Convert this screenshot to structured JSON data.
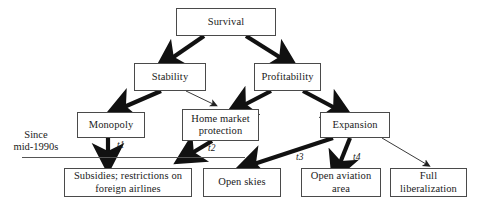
{
  "diagram": {
    "colors": {
      "box_border": "#4a4a4a",
      "box_fill": "#ffffff",
      "arrow_thick": "#111111",
      "arrow_thin": "#333333",
      "text": "#1a1a1a",
      "timeline_line": "#555555"
    },
    "nodes": [
      {
        "id": "survival",
        "label": "Survival"
      },
      {
        "id": "stability",
        "label": "Stability"
      },
      {
        "id": "profitability",
        "label": "Profitability"
      },
      {
        "id": "monopoly",
        "label": "Monopoly"
      },
      {
        "id": "home-market-protection",
        "label": "Home market protection"
      },
      {
        "id": "expansion",
        "label": "Expansion"
      },
      {
        "id": "subsidies-restrictions",
        "label": "Subsidies; restrictions on foreign airlines"
      },
      {
        "id": "open-skies",
        "label": "Open skies"
      },
      {
        "id": "open-aviation-area",
        "label": "Open aviation area"
      },
      {
        "id": "full-liberalization",
        "label": "Full liberalization"
      }
    ],
    "node_labels": {
      "survival": "Survival",
      "stability": "Stability",
      "profitability": "Profitability",
      "monopoly": "Monopoly",
      "home_market_protection_line1": "Home market",
      "home_market_protection_line2": "protection",
      "expansion": "Expansion",
      "subsidies_line1": "Subsidies; restrictions on",
      "subsidies_line2": "foreign airlines",
      "open_skies": "Open skies",
      "open_aviation_line1": "Open aviation",
      "open_aviation_line2": "area",
      "full_liberalization_line1": "Full",
      "full_liberalization_line2": "liberalization"
    },
    "timeline": {
      "label_line1": "Since",
      "label_line2": "mid-1990s"
    },
    "transition_labels": {
      "t1": "t1",
      "t2": "t2",
      "t3": "t3",
      "t4": "t4"
    },
    "edges": [
      {
        "from": "survival",
        "to": "stability",
        "weight": "thick"
      },
      {
        "from": "survival",
        "to": "profitability",
        "weight": "thick"
      },
      {
        "from": "stability",
        "to": "monopoly",
        "weight": "thick"
      },
      {
        "from": "stability",
        "to": "home-market-protection",
        "weight": "thin"
      },
      {
        "from": "profitability",
        "to": "home-market-protection",
        "weight": "thick"
      },
      {
        "from": "profitability",
        "to": "expansion",
        "weight": "thick"
      },
      {
        "from": "monopoly",
        "to": "subsidies-restrictions",
        "weight": "thick",
        "label": "t1"
      },
      {
        "from": "home-market-protection",
        "to": "subsidies-restrictions",
        "weight": "thick",
        "label": "t2"
      },
      {
        "from": "expansion",
        "to": "open-skies",
        "weight": "thick",
        "label": "t3"
      },
      {
        "from": "expansion",
        "to": "open-aviation-area",
        "weight": "thick",
        "label": "t4"
      },
      {
        "from": "expansion",
        "to": "full-liberalization",
        "weight": "thin"
      }
    ]
  }
}
